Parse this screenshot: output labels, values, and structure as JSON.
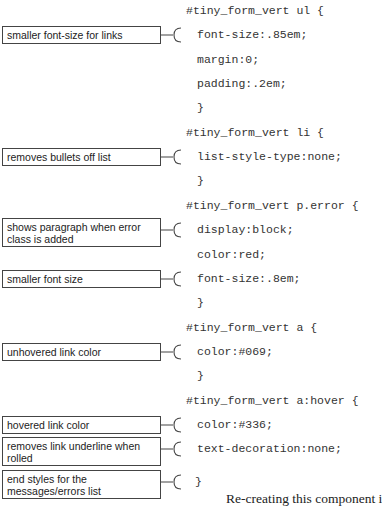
{
  "code_lines": [
    {
      "text": "#tiny_form_vert ul {",
      "indent": false,
      "y": 11
    },
    {
      "text": "font-size:.85em;",
      "indent": true,
      "y": 35
    },
    {
      "text": "margin:0;",
      "indent": true,
      "y": 60
    },
    {
      "text": "padding:.2em;",
      "indent": true,
      "y": 84
    },
    {
      "text": "}",
      "indent": true,
      "y": 108
    },
    {
      "text": "#tiny_form_vert li {",
      "indent": false,
      "y": 133
    },
    {
      "text": "list-style-type:none;",
      "indent": true,
      "y": 157
    },
    {
      "text": "}",
      "indent": true,
      "y": 181
    },
    {
      "text": "#tiny_form_vert p.error {",
      "indent": false,
      "y": 206
    },
    {
      "text": "display:block;",
      "indent": true,
      "y": 230
    },
    {
      "text": "color:red;",
      "indent": true,
      "y": 255
    },
    {
      "text": "font-size:.8em;",
      "indent": true,
      "y": 279
    },
    {
      "text": "}",
      "indent": true,
      "y": 303
    },
    {
      "text": "#tiny_form_vert a {",
      "indent": false,
      "y": 328
    },
    {
      "text": "color:#069;",
      "indent": true,
      "y": 352
    },
    {
      "text": "}",
      "indent": true,
      "y": 376
    },
    {
      "text": "#tiny_form_vert a:hover {",
      "indent": false,
      "y": 401
    },
    {
      "text": "color:#336;",
      "indent": true,
      "y": 425
    },
    {
      "text": "text-decoration:none;",
      "indent": true,
      "y": 449
    },
    {
      "text": "}",
      "indent": false,
      "y": 474
    }
  ],
  "annotations": [
    {
      "text": "smaller font-size for links",
      "top": 26,
      "height": 18,
      "anchor_y": 35
    },
    {
      "text": "removes bullets off list",
      "top": 148,
      "height": 18,
      "anchor_y": 157
    },
    {
      "text": "shows paragraph when error class is added",
      "top": 218,
      "height": 29,
      "anchor_y": 230
    },
    {
      "text": "smaller font size",
      "top": 270,
      "height": 18,
      "anchor_y": 279
    },
    {
      "text": "unhovered link color",
      "top": 343,
      "height": 18,
      "anchor_y": 352
    },
    {
      "text": "hovered link color",
      "top": 416,
      "height": 18,
      "anchor_y": 425
    },
    {
      "text": "removes link underline when rolled",
      "top": 437,
      "height": 29,
      "anchor_y": 449
    },
    {
      "text": "end styles for the messages/errors list",
      "top": 470,
      "height": 29,
      "anchor_y": 482
    }
  ],
  "body_text": "Re-creating this component i"
}
